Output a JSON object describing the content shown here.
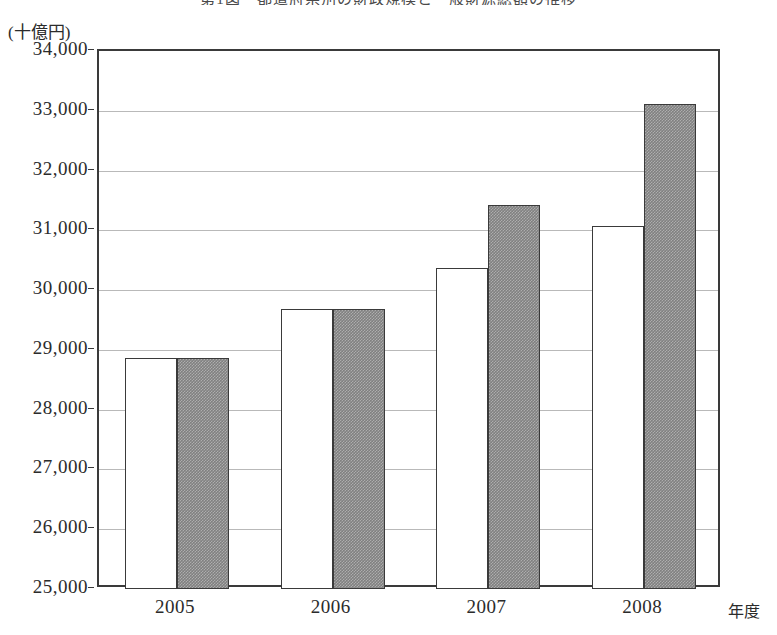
{
  "chart_data": {
    "type": "bar",
    "title": "第1図　都道府県別の財政規模と一般財源総額の推移",
    "unit_label": "(十億円)",
    "xlabel": "年度",
    "ylabel": "",
    "categories": [
      "2005",
      "2006",
      "2007",
      "2008"
    ],
    "ylim": [
      25000,
      34000
    ],
    "ytick_step": 1000,
    "yticks": [
      34000,
      33000,
      32000,
      31000,
      30000,
      29000,
      28000,
      27000,
      26000,
      25000
    ],
    "ytick_labels": [
      "34,000",
      "33,000",
      "32,000",
      "31,000",
      "30,000",
      "29,000",
      "28,000",
      "27,000",
      "26,000",
      "25,000"
    ],
    "grid": true,
    "grid_axis": "y",
    "legend": null,
    "legend_position": "none",
    "series": [
      {
        "name": "series-1-white",
        "style": "white",
        "fill": "#ffffff",
        "edge": "#3a3a3a",
        "values": [
          28870,
          29690,
          30370,
          31080
        ]
      },
      {
        "name": "series-2-gray",
        "style": "gray-hatch",
        "fill": "#808080",
        "edge": "#3a3a3a",
        "values": [
          28870,
          29690,
          31430,
          33120
        ]
      }
    ]
  },
  "colors": {
    "frame": "#3a3a3a",
    "gridline": "#b9b9b9",
    "bar_white": "#ffffff",
    "bar_gray": "#808080",
    "text": "#2b2b2b",
    "background": "#ffffff"
  }
}
